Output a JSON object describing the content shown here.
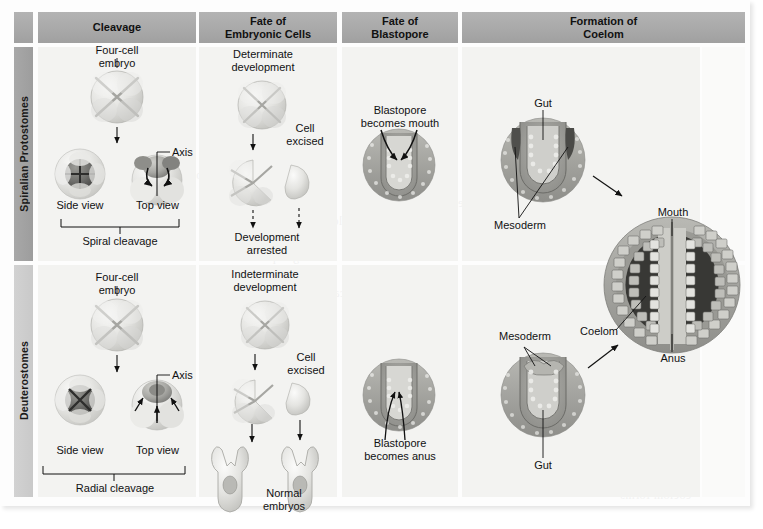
{
  "figure": {
    "kind": "comparison-table",
    "title_hidden": "Protostome vs Deuterostome development",
    "columns": [
      {
        "id": "cleavage",
        "label_line1": "Cleavage",
        "label_line2": ""
      },
      {
        "id": "fate-embryonic-cells",
        "label_line1": "Fate of",
        "label_line2": "Embryonic Cells"
      },
      {
        "id": "fate-blastopore",
        "label_line1": "Fate of",
        "label_line2": "Blastopore"
      },
      {
        "id": "formation-coelom",
        "label_line1": "Formation of",
        "label_line2": "Coelom"
      }
    ],
    "rows": [
      {
        "id": "spiralian-protostomes",
        "label": "Spiralian Protostomes"
      },
      {
        "id": "deuterostomes",
        "label": "Deuterostomes"
      }
    ],
    "colors": {
      "header_bar": "#a9a9a9",
      "row_label_top": "#a3a3a3",
      "row_label_bottom": "#cccccc",
      "panel": "#f3f3f1",
      "text": "#111111"
    }
  },
  "protostome": {
    "cleavage": {
      "four_cell_embryo": "Four-cell\nembryo",
      "four_cell_line1": "Four-cell",
      "four_cell_line2": "embryo",
      "side_view": "Side view",
      "top_view": "Top view",
      "axis": "Axis",
      "caption": "Spiral cleavage"
    },
    "fate_cells": {
      "heading_line1": "Determinate",
      "heading_line2": "development",
      "cell_excised_line1": "Cell",
      "cell_excised_line2": "excised",
      "result_line1": "Development",
      "result_line2": "arrested"
    },
    "blastopore": {
      "caption_line1": "Blastopore",
      "caption_line2": "becomes mouth"
    },
    "coelom": {
      "gut": "Gut",
      "mesoderm": "Mesoderm"
    }
  },
  "deuterostome": {
    "cleavage": {
      "four_cell_line1": "Four-cell",
      "four_cell_line2": "embryo",
      "side_view": "Side view",
      "top_view": "Top view",
      "axis": "Axis",
      "caption": "Radial cleavage"
    },
    "fate_cells": {
      "heading_line1": "Indeterminate",
      "heading_line2": "development",
      "cell_excised_line1": "Cell",
      "cell_excised_line2": "excised",
      "result_line1": "Normal",
      "result_line2": "embryos"
    },
    "blastopore": {
      "caption_line1": "Blastopore",
      "caption_line2": "becomes anus"
    },
    "coelom": {
      "mesoderm": "Mesoderm",
      "gut": "Gut"
    }
  },
  "final_section": {
    "mouth": "Mouth",
    "coelom": "Coelom",
    "anus": "Anus"
  },
  "showthrough": [
    {
      "text": "ferences in the",
      "x": 420,
      "y": 196
    },
    {
      "text": "development",
      "x": 300,
      "y": 214
    },
    {
      "text": "the two major",
      "x": 470,
      "y": 232
    },
    {
      "text": "groups of",
      "x": 250,
      "y": 250
    },
    {
      "text": "bilaterally",
      "x": 560,
      "y": 268
    },
    {
      "text": "symmetrical",
      "x": 330,
      "y": 286
    },
    {
      "text": "animals",
      "x": 600,
      "y": 150
    },
    {
      "text": "embryonic",
      "x": 180,
      "y": 168
    },
    {
      "text": "cleavage",
      "x": 640,
      "y": 310
    },
    {
      "text": "protostome",
      "x": 100,
      "y": 470
    },
    {
      "text": "deuterostome",
      "x": 520,
      "y": 452
    },
    {
      "text": "coelom forms",
      "x": 620,
      "y": 488
    }
  ]
}
